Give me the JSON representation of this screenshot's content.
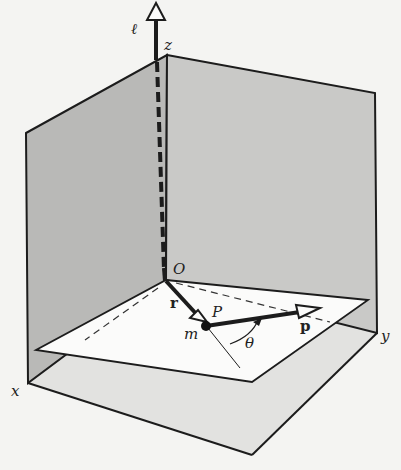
{
  "diagram": {
    "type": "3d-coordinate-figure",
    "labels": {
      "axis_line": "ℓ",
      "z_axis": "z",
      "y_axis": "y",
      "x_axis": "x",
      "origin": "O",
      "point": "P",
      "mass": "m",
      "position_vector": "r",
      "momentum_vector": "p",
      "angle": "θ"
    },
    "colors": {
      "background": "#f4f4f2",
      "wall_left": "#b9b9b7",
      "wall_right": "#c9c9c7",
      "floor": "#e2e2e0",
      "plane": "#fbfbfa",
      "stroke": "#1c1c1c"
    }
  }
}
